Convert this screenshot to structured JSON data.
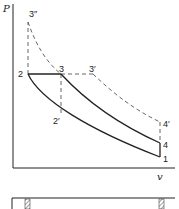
{
  "diagram": {
    "type": "pv-diagram",
    "axes": {
      "y_label": "P",
      "x_label": "v"
    },
    "points": {
      "p1": "1",
      "p2": "2",
      "p2prime": "2′",
      "p3": "3",
      "p3prime": "3′",
      "p3dprime": "3″",
      "p4": "4",
      "p4prime": "4′"
    },
    "colors": {
      "line": "#222222",
      "dashed": "#555555",
      "hatch": "#444444"
    }
  }
}
